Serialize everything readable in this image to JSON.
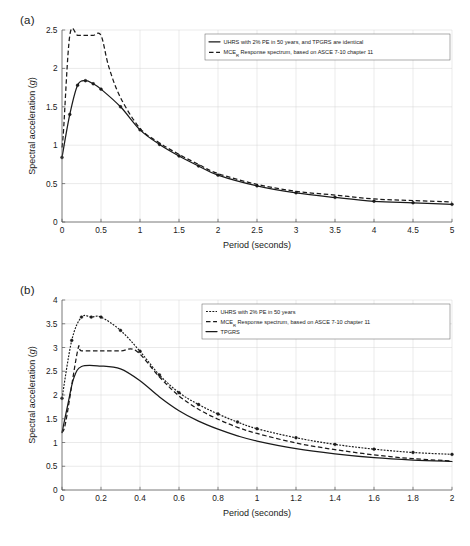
{
  "figure": {
    "panel_a_label": "(a)",
    "panel_b_label": "(b)",
    "axis_color": "#1a1a1a",
    "grid_color": "#d5d5d5"
  },
  "chart_data": [
    {
      "id": "panel-a",
      "type": "line",
      "title": "",
      "panel": "(a)",
      "xlabel": "Period (seconds)",
      "ylabel": "Spectral acceleration (g)",
      "xlim": [
        0,
        5
      ],
      "ylim": [
        0,
        2.5
      ],
      "xticks": [
        0,
        0.5,
        1,
        1.5,
        2,
        2.5,
        3,
        3.5,
        4,
        4.5,
        5
      ],
      "xtick_labels": [
        "0",
        "0.5",
        "1",
        "1.5",
        "2",
        "2.5",
        "3",
        "3.5",
        "4",
        "4.5",
        "5"
      ],
      "yticks": [
        0,
        0.5,
        1,
        1.5,
        2,
        2.5
      ],
      "ytick_labels": [
        "0",
        "0.5",
        "1",
        "1.5",
        "2",
        "2.5"
      ],
      "grid": true,
      "legend_position": "upper right",
      "series": [
        {
          "name": "UHRS with 2% PE in 50 years, and TPGRS are identical",
          "style": "solid",
          "markers": true,
          "x": [
            0,
            0.1,
            0.2,
            0.3,
            0.4,
            0.5,
            0.75,
            1,
            1.25,
            1.5,
            1.75,
            2,
            2.5,
            3,
            3.5,
            4,
            4.5,
            5
          ],
          "y": [
            0.84,
            1.4,
            1.78,
            1.84,
            1.8,
            1.73,
            1.5,
            1.2,
            1.01,
            0.86,
            0.73,
            0.61,
            0.47,
            0.38,
            0.32,
            0.27,
            0.25,
            0.23
          ]
        },
        {
          "name": "MCE_R Response spectrum, based on ASCE 7-10 chapter 11",
          "label_prefix": "MCE",
          "label_sub": "R",
          "label_rest": " Response spectrum, based on ASCE 7-10 chapter 11",
          "style": "dashed",
          "markers": false,
          "x": [
            0,
            0.02,
            0.1,
            0.2,
            0.3,
            0.4,
            0.5,
            0.6,
            0.75,
            1,
            1.25,
            1.5,
            1.75,
            2,
            2.5,
            3,
            3.5,
            4,
            4.5,
            5
          ],
          "y": [
            0.97,
            1.2,
            2.43,
            2.43,
            2.43,
            2.43,
            2.43,
            2.02,
            1.62,
            1.22,
            1.03,
            0.88,
            0.75,
            0.63,
            0.49,
            0.4,
            0.35,
            0.3,
            0.28,
            0.26
          ]
        }
      ]
    },
    {
      "id": "panel-b",
      "type": "line",
      "title": "",
      "panel": "(b)",
      "xlabel": "Period (seconds)",
      "ylabel": "Spectral acceleration (g)",
      "xlim": [
        0,
        2
      ],
      "ylim": [
        0,
        4
      ],
      "xticks": [
        0,
        0.2,
        0.4,
        0.6,
        0.8,
        1,
        1.2,
        1.4,
        1.6,
        1.8,
        2
      ],
      "xtick_labels": [
        "0",
        "0.2",
        "0.4",
        "0.6",
        "0.8",
        "1",
        "1.2",
        "1.4",
        "1.6",
        "1.8",
        "2"
      ],
      "yticks": [
        0,
        0.5,
        1,
        1.5,
        2,
        2.5,
        3,
        3.5,
        4
      ],
      "ytick_labels": [
        "0",
        "0.5",
        "1",
        "1.5",
        "2",
        "2.5",
        "3",
        "3.5",
        "4"
      ],
      "grid": true,
      "legend_position": "upper right",
      "series": [
        {
          "name": "UHRS with 2% PE in 50 years",
          "style": "dotted",
          "markers": true,
          "x": [
            0,
            0.05,
            0.1,
            0.15,
            0.2,
            0.3,
            0.4,
            0.5,
            0.6,
            0.7,
            0.8,
            0.9,
            1,
            1.2,
            1.4,
            1.6,
            1.8,
            2
          ],
          "y": [
            1.93,
            3.15,
            3.64,
            3.64,
            3.64,
            3.36,
            2.92,
            2.42,
            2.05,
            1.8,
            1.6,
            1.43,
            1.29,
            1.1,
            0.96,
            0.86,
            0.79,
            0.75
          ]
        },
        {
          "name": "MCE_R Response spectrum, based on ASCE 7-10 chapter 11",
          "label_prefix": "MCE",
          "label_sub": "R",
          "label_rest": " Response spectrum, based on ASCE 7-10 chapter 11",
          "style": "dashed",
          "markers": false,
          "x": [
            0,
            0.02,
            0.08,
            0.1,
            0.2,
            0.3,
            0.38,
            0.5,
            0.6,
            0.7,
            0.8,
            0.9,
            1,
            1.2,
            1.4,
            1.6,
            1.8,
            2
          ],
          "y": [
            1.21,
            1.45,
            2.93,
            2.93,
            2.93,
            2.93,
            2.93,
            2.38,
            1.98,
            1.7,
            1.49,
            1.32,
            1.19,
            0.99,
            0.85,
            0.74,
            0.66,
            0.61
          ]
        },
        {
          "name": "TPGRS",
          "style": "solid",
          "markers": false,
          "x": [
            0,
            0.03,
            0.06,
            0.1,
            0.2,
            0.3,
            0.4,
            0.5,
            0.6,
            0.7,
            0.8,
            0.9,
            1,
            1.2,
            1.4,
            1.6,
            1.8,
            2
          ],
          "y": [
            1.21,
            1.8,
            2.35,
            2.6,
            2.61,
            2.55,
            2.3,
            1.96,
            1.67,
            1.45,
            1.28,
            1.14,
            1.03,
            0.87,
            0.76,
            0.68,
            0.63,
            0.6
          ]
        }
      ]
    }
  ]
}
